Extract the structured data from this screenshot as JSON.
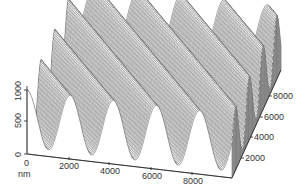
{
  "chart_data": {
    "type": "surface3d",
    "title": "",
    "x_axis": {
      "label": "nm",
      "ticks": [
        0,
        2000,
        4000,
        6000,
        8000
      ],
      "range": [
        0,
        9500
      ]
    },
    "y_axis": {
      "label": "",
      "ticks": [
        2000,
        4000,
        6000,
        8000
      ],
      "range": [
        0,
        9500
      ]
    },
    "z_axis": {
      "label": "",
      "ticks": [
        0,
        500,
        1000
      ],
      "range": [
        0,
        1100
      ]
    },
    "surface": {
      "pattern": "sinusoidal ridges running diagonally",
      "ridge_count": 6,
      "period_nm": 1600,
      "amplitude_nm": 450,
      "mean_height_nm": 550
    },
    "grid": false,
    "legend": null
  },
  "axes": {
    "z_tick_labels": [
      "0",
      "500",
      "1000"
    ],
    "x_tick_labels": [
      "0",
      "2000",
      "4000",
      "6000",
      "8000"
    ],
    "y_tick_labels": [
      "2000",
      "4000",
      "6000",
      "8000"
    ],
    "unit": "nm"
  }
}
